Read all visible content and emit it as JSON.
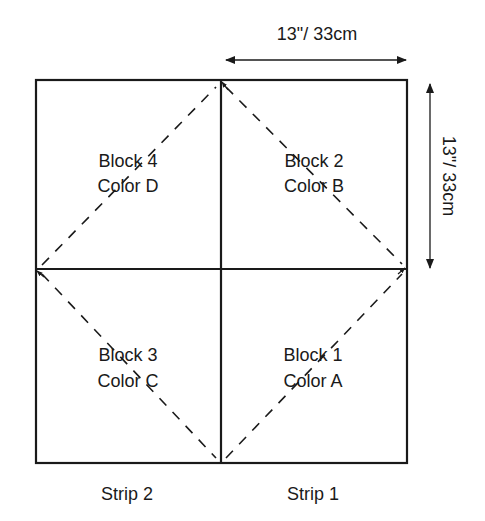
{
  "diagram": {
    "type": "quilt-block-layout",
    "dimensions": {
      "width_label": "13\"/ 33cm",
      "height_label": "13\"/ 33cm"
    },
    "blocks": [
      {
        "name": "Block 4",
        "color": "Color D",
        "position": "top-left"
      },
      {
        "name": "Block 2",
        "color": "Color B",
        "position": "top-right"
      },
      {
        "name": "Block 3",
        "color": "Color C",
        "position": "bottom-left"
      },
      {
        "name": "Block 1",
        "color": "Color A",
        "position": "bottom-right"
      }
    ],
    "strips": [
      {
        "label": "Strip 2",
        "position": "left"
      },
      {
        "label": "Strip 1",
        "position": "right"
      }
    ],
    "colors": {
      "line": "#1a1a1a",
      "background": "#ffffff"
    }
  }
}
